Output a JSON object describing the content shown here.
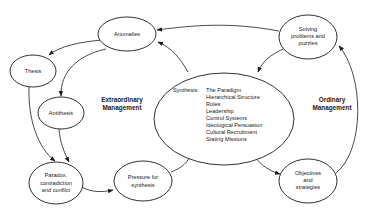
{
  "diagram": {
    "nodes": {
      "anomalies": {
        "label": "Anomalies"
      },
      "thesis": {
        "label": "Thesis"
      },
      "antithesis": {
        "label": "Antithesis"
      },
      "paradox": {
        "lines": [
          "Paradox,",
          "contradiction",
          "and conflict"
        ]
      },
      "pressure": {
        "lines": [
          "Pressure for",
          "synthesis"
        ]
      },
      "synthesis": {
        "prefix": "Synthesis:",
        "items": [
          "The Paradigm",
          "Hierarchical Structure",
          "Roles",
          "Leadership",
          "Control Systems",
          "Ideological Persuasion",
          "Cultural Recruitment",
          "Stating Missions"
        ]
      },
      "solving": {
        "lines": [
          "Solving",
          "problems and",
          "puzzles"
        ]
      },
      "objectives": {
        "lines": [
          "Objectives",
          "and",
          "strategies"
        ]
      }
    },
    "region_labels": {
      "extraordinary": [
        "Extraordinary",
        "Management"
      ],
      "ordinary": [
        "Ordinary",
        "Management"
      ]
    },
    "edges": [
      {
        "from": "solving",
        "to": "anomalies"
      },
      {
        "from": "synthesis",
        "to": "anomalies"
      },
      {
        "from": "anomalies",
        "to": "thesis"
      },
      {
        "from": "anomalies",
        "to": "antithesis"
      },
      {
        "from": "thesis",
        "to": "paradox"
      },
      {
        "from": "antithesis",
        "to": "paradox"
      },
      {
        "from": "paradox",
        "to": "pressure"
      },
      {
        "from": "pressure",
        "to": "synthesis"
      },
      {
        "from": "synthesis",
        "to": "objectives"
      },
      {
        "from": "objectives",
        "to": "solving"
      },
      {
        "from": "solving",
        "to": "synthesis"
      }
    ]
  }
}
